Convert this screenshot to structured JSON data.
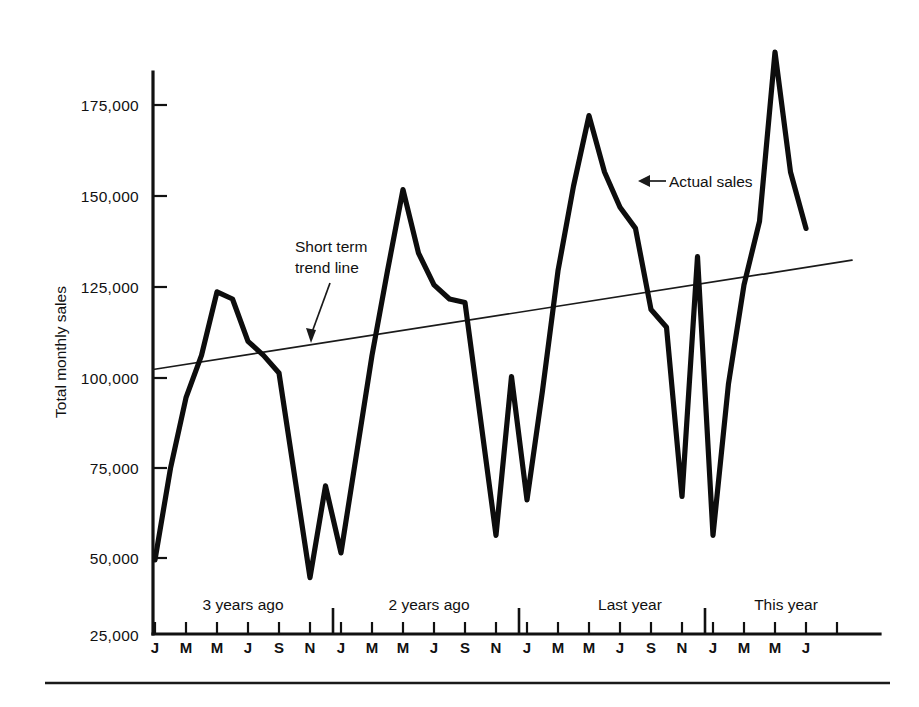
{
  "chart_data": {
    "type": "line",
    "title": "",
    "subtitle": "",
    "xlabel": "",
    "ylabel": "Total monthly sales",
    "ylim": [
      25000,
      195000
    ],
    "yticks": [
      25000,
      50000,
      75000,
      100000,
      125000,
      150000,
      175000
    ],
    "ytick_labels": [
      "25,000",
      "50,000",
      "75,000",
      "100,000",
      "125,000",
      "150,000",
      "175,000"
    ],
    "grid": false,
    "legend": "none",
    "x_tick_labels": [
      "J",
      "M",
      "M",
      "J",
      "S",
      "N",
      "J",
      "M",
      "M",
      "J",
      "S",
      "N",
      "J",
      "M",
      "M",
      "J",
      "S",
      "N",
      "J",
      "M",
      "M",
      "J"
    ],
    "period_labels": [
      "3 years ago",
      "2 years ago",
      "Last year",
      "This year"
    ],
    "series": [
      {
        "name": "Actual sales",
        "x": [
          "J",
          "F",
          "M",
          "A",
          "M",
          "J",
          "J",
          "A",
          "S",
          "O",
          "N",
          "D",
          "J",
          "F",
          "M",
          "A",
          "M",
          "J",
          "J",
          "A",
          "S",
          "O",
          "N",
          "D",
          "J",
          "F",
          "M",
          "A",
          "M",
          "J",
          "J",
          "A",
          "S",
          "O",
          "N",
          "D",
          "J",
          "F",
          "M",
          "A",
          "M",
          "J",
          "J"
        ],
        "values": [
          46000,
          72000,
          92000,
          104000,
          122000,
          120000,
          108000,
          104000,
          99000,
          70000,
          41000,
          67000,
          48000,
          76000,
          104000,
          128000,
          151000,
          133000,
          124000,
          120000,
          119000,
          86000,
          53000,
          98000,
          63000,
          94000,
          128000,
          152000,
          172000,
          156000,
          146000,
          140000,
          117000,
          112000,
          64000,
          132000,
          53000,
          96000,
          124000,
          142000,
          190000,
          156000,
          140000
        ]
      },
      {
        "name": "Short term trend line",
        "x_endpoints": [
          "J (3 years ago)",
          "J (this year)"
        ],
        "values": [
          100000,
          131000
        ]
      }
    ],
    "annotations": [
      {
        "name": "trend-annotation",
        "text_line1": "Short term",
        "text_line2": "trend line",
        "points_to": "Short term trend line"
      },
      {
        "name": "actual-annotation",
        "text": "Actual sales",
        "points_to": "Actual sales curve"
      }
    ]
  },
  "axis": {
    "y_title": "Total monthly sales"
  },
  "colors": {
    "series": "#0d0d0d",
    "trend": "#1a1a1a",
    "axis": "#111111",
    "background": "#ffffff"
  }
}
